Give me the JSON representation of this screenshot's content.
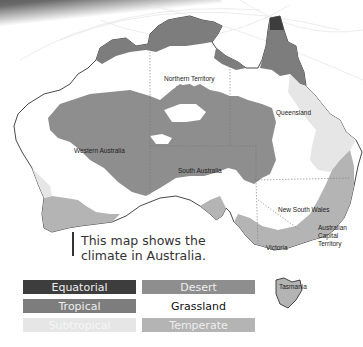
{
  "map": {
    "title": "Climate in Australia",
    "regions": {
      "northern_territory": "Northern Territory",
      "queensland": "Queensland",
      "western_australia": "Western Australia",
      "south_australia": "South Australia",
      "new_south_wales": "New South Wales",
      "act_line1": "Australian",
      "act_line2": "Capital",
      "act_line3": "Territory",
      "victoria": "Victoria",
      "tasmania": "Tasmania"
    },
    "colors": {
      "equatorial": "#3d3d3d",
      "tropical": "#7d7d7d",
      "subtropical": "#e6e6e6",
      "desert": "#8e8e8e",
      "grassland": "#ffffff",
      "temperate": "#b4b4b4",
      "outline": "#333333"
    }
  },
  "caption": {
    "text": "This map shows the climate in Australia."
  },
  "legend": {
    "items": [
      {
        "label": "Equatorial",
        "color": "#3d3d3d",
        "text_color": "#eeeeee"
      },
      {
        "label": "Desert",
        "color": "#8e8e8e",
        "text_color": "#eeeeee"
      },
      {
        "label": "Tropical",
        "color": "#7d7d7d",
        "text_color": "#eeeeee"
      },
      {
        "label": "Grassland",
        "color": "#ffffff",
        "text_color": "#111111"
      },
      {
        "label": "Subtropical",
        "color": "#e6e6e6",
        "text_color": "#f6f6f6"
      },
      {
        "label": "Temperate",
        "color": "#b4b4b4",
        "text_color": "#eeeeee"
      }
    ]
  }
}
